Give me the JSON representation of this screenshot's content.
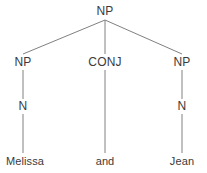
{
  "diagram": {
    "type": "syntax-tree",
    "sentence": "Melissa and Jean",
    "background_color": "#ffffff",
    "edge_color": "#808080",
    "text_color": "#3a3a3a",
    "nodes": [
      {
        "id": "root-np",
        "label": "NP",
        "kind": "nonterminal",
        "x": 105,
        "y": 11
      },
      {
        "id": "left-np",
        "label": "NP",
        "kind": "nonterminal",
        "x": 23,
        "y": 62
      },
      {
        "id": "conj",
        "label": "CONJ",
        "kind": "nonterminal",
        "x": 105,
        "y": 62
      },
      {
        "id": "right-np",
        "label": "NP",
        "kind": "nonterminal",
        "x": 182,
        "y": 62
      },
      {
        "id": "left-n",
        "label": "N",
        "kind": "nonterminal",
        "x": 23,
        "y": 106
      },
      {
        "id": "right-n",
        "label": "N",
        "kind": "nonterminal",
        "x": 182,
        "y": 106
      },
      {
        "id": "melissa",
        "label": "Melissa",
        "kind": "terminal",
        "x": 25,
        "y": 161
      },
      {
        "id": "and",
        "label": "and",
        "kind": "terminal",
        "x": 105,
        "y": 161
      },
      {
        "id": "jean",
        "label": "Jean",
        "kind": "terminal",
        "x": 182,
        "y": 161
      }
    ],
    "edges": [
      {
        "from": "root-np",
        "to": "left-np",
        "x1": 105,
        "y1": 20,
        "x2": 23,
        "y2": 54
      },
      {
        "from": "root-np",
        "to": "conj",
        "x1": 105,
        "y1": 20,
        "x2": 105,
        "y2": 54
      },
      {
        "from": "root-np",
        "to": "right-np",
        "x1": 105,
        "y1": 20,
        "x2": 182,
        "y2": 54
      },
      {
        "from": "left-np",
        "to": "left-n",
        "x1": 23,
        "y1": 70,
        "x2": 23,
        "y2": 99
      },
      {
        "from": "conj",
        "to": "and",
        "x1": 105,
        "y1": 70,
        "x2": 105,
        "y2": 153
      },
      {
        "from": "right-np",
        "to": "right-n",
        "x1": 182,
        "y1": 70,
        "x2": 182,
        "y2": 99
      },
      {
        "from": "left-n",
        "to": "melissa",
        "x1": 23,
        "y1": 114,
        "x2": 23,
        "y2": 153
      },
      {
        "from": "right-n",
        "to": "jean",
        "x1": 182,
        "y1": 114,
        "x2": 182,
        "y2": 153
      }
    ]
  }
}
